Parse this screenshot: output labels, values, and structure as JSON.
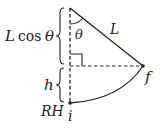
{
  "diagram": {
    "type": "pendulum-geometry",
    "labels": {
      "length_vertical": "L",
      "cos": "cos",
      "theta_vertical": "θ",
      "angle": "θ",
      "string": "L",
      "height": "h",
      "reference": "RH",
      "initial_point": "i",
      "final_point": "f"
    },
    "points": {
      "pivot": [
        70,
        8
      ],
      "final": [
        143,
        66
      ],
      "initial": [
        70,
        103
      ],
      "foot": [
        70,
        66
      ]
    },
    "colors": {
      "stroke": "#222222",
      "background": "#ffffff"
    }
  }
}
